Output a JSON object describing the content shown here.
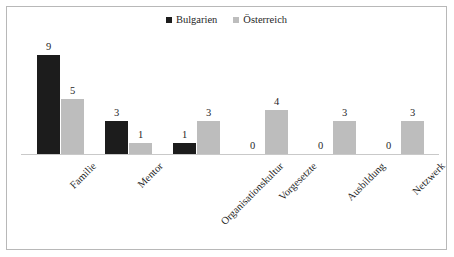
{
  "chart_data": {
    "type": "bar",
    "title": "",
    "subtitle": "",
    "xlabel": "",
    "ylabel": "",
    "ylim": [
      0,
      9
    ],
    "grid": false,
    "legend_position": "top-center",
    "categories": [
      "Familie",
      "Mentor",
      "Organisationskultur",
      "Vorgesetzte",
      "Ausbildung",
      "Netzwerk"
    ],
    "series": [
      {
        "name": "Bulgarien",
        "color": "#1c1c1c",
        "values": [
          9,
          3,
          1,
          0,
          0,
          0
        ],
        "labels": [
          "9",
          "3",
          "1",
          "0",
          "0",
          "0"
        ]
      },
      {
        "name": "Österreich",
        "color": "#bdbdbd",
        "values": [
          5,
          1,
          3,
          4,
          3,
          3
        ],
        "labels": [
          "5",
          "1",
          "3",
          "4",
          "3",
          "3"
        ]
      }
    ]
  },
  "legend": {
    "items": [
      {
        "label": "Bulgarien",
        "color": "#1c1c1c"
      },
      {
        "label": "Österreich",
        "color": "#bdbdbd"
      }
    ]
  },
  "style": {
    "border_color": "#b8b8b8",
    "axis_color": "#c9c9c9",
    "background": "#ffffff",
    "text_color": "#1f1f1f"
  }
}
